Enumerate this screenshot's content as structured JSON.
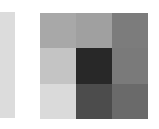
{
  "left_strip": {
    "color": "#dcdcdc"
  },
  "grid": {
    "rows": 3,
    "cols": 3,
    "cells": [
      [
        "#a8a8a8",
        "#a0a0a0",
        "#7c7c7c"
      ],
      [
        "#c4c4c4",
        "#282828",
        "#7a7a7a"
      ],
      [
        "#dadada",
        "#4c4c4c",
        "#6a6a6a"
      ]
    ]
  }
}
